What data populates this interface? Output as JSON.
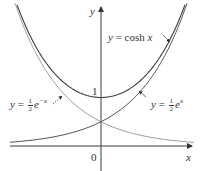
{
  "chart_data": {
    "type": "line",
    "title": "",
    "xlabel": "x",
    "ylabel": "y",
    "origin_label": "0",
    "y_tick_labels": [
      "1"
    ],
    "xlim": [
      -1.9,
      1.9
    ],
    "ylim": [
      0,
      2.9
    ],
    "grid": false,
    "legend": "inline annotations",
    "series": [
      {
        "name": "y = cosh x",
        "label_text": "y = cosh x",
        "style": "dark",
        "color": "#3a3a3a",
        "x": [
          -1.8,
          -1.5,
          -1.0,
          -0.5,
          0,
          0.5,
          1.0,
          1.5,
          1.8
        ],
        "y": [
          3.107,
          2.352,
          1.543,
          1.128,
          1.0,
          1.128,
          1.543,
          2.352,
          3.107
        ]
      },
      {
        "name": "y = ½ e^x",
        "label_text": "y = ½ eˣ",
        "style": "dark",
        "color": "#4a4a4a",
        "x": [
          -1.9,
          -1.5,
          -1.0,
          -0.5,
          0,
          0.5,
          1.0,
          1.5,
          1.75
        ],
        "y": [
          0.075,
          0.112,
          0.184,
          0.303,
          0.5,
          0.824,
          1.359,
          2.241,
          2.877
        ]
      },
      {
        "name": "y = ½ e^-x",
        "label_text": "y = ½ e⁻ˣ",
        "style": "light",
        "color": "#9a9a9a",
        "x": [
          -1.75,
          -1.5,
          -1.0,
          -0.5,
          0,
          0.5,
          1.0,
          1.5,
          1.9
        ],
        "y": [
          2.877,
          2.241,
          1.359,
          0.824,
          0.5,
          0.303,
          0.184,
          0.112,
          0.075
        ]
      }
    ],
    "annotations": [
      {
        "text": "y = cosh x",
        "pointer": "arrow to cosh curve near x≈1.5"
      },
      {
        "text": "y = ½ e^x",
        "pointer": "arrow to ½e^x curve near x≈0.5"
      },
      {
        "text": "y = ½ e^-x",
        "pointer": "arrow to ½e^-x curve near x≈-0.5"
      }
    ]
  },
  "labels": {
    "y_axis": "y",
    "x_axis": "x",
    "origin": "0",
    "one": "1",
    "cosh": {
      "lhs": "y",
      "eq": " = cosh ",
      "var": "x"
    },
    "exp_pos": {
      "lhs": "y",
      "eq": " = ",
      "num": "1",
      "den": "2",
      "base": "e",
      "exp": "x"
    },
    "exp_neg": {
      "lhs": "y",
      "eq": " = ",
      "num": "1",
      "den": "2",
      "base": "e",
      "exp": "−x"
    }
  },
  "colors": {
    "axis": "#3a3a3a",
    "cosh": "#3a3a3a",
    "exp_pos": "#555555",
    "exp_neg": "#a0a0a0"
  }
}
